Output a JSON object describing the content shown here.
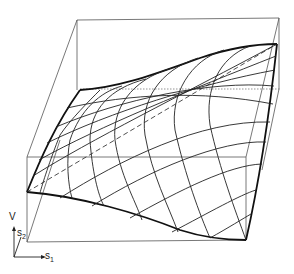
{
  "figure": {
    "axes": {
      "vertical_label": "V",
      "axis2_label": "s",
      "axis2_subscript": "2",
      "axis1_label": "s",
      "axis1_subscript": "1"
    },
    "colors": {
      "background": "#ffffff",
      "lines": "#222222",
      "box": "#555555"
    }
  }
}
